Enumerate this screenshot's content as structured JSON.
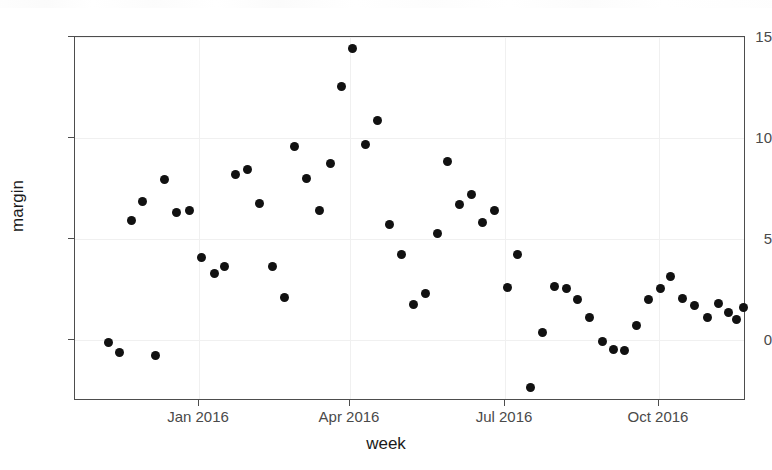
{
  "chart_data": {
    "type": "scatter",
    "title": "",
    "xlabel": "week",
    "ylabel": "margin",
    "grid": true,
    "legend": null,
    "xtick_labels": [
      "Jan 2016",
      "Apr 2016",
      "Jul 2016",
      "Oct 2016"
    ],
    "ytick_labels": [
      "15",
      "10",
      "5",
      "0"
    ],
    "ytick_values": [
      15,
      10,
      5,
      0
    ],
    "ylim": [
      -3.6,
      15.0
    ],
    "xlim_labels": [
      "Nov 2015",
      "Dec 2016"
    ],
    "marker": "filled-circle",
    "marker_color": "#111111",
    "x": [
      "2015-11-15",
      "2015-11-22",
      "2015-11-29",
      "2015-12-06",
      "2015-12-13",
      "2015-12-20",
      "2015-12-27",
      "2016-01-03",
      "2016-01-10",
      "2016-01-17",
      "2016-01-24",
      "2016-01-31",
      "2016-02-07",
      "2016-02-14",
      "2016-02-21",
      "2016-02-28",
      "2016-03-06",
      "2016-03-13",
      "2016-03-20",
      "2016-03-27",
      "2016-04-03",
      "2016-04-10",
      "2016-04-17",
      "2016-04-24",
      "2016-05-01",
      "2016-05-08",
      "2016-05-15",
      "2016-05-22",
      "2016-05-29",
      "2016-06-05",
      "2016-06-12",
      "2016-06-19",
      "2016-06-26",
      "2016-07-03",
      "2016-07-10",
      "2016-07-17",
      "2016-07-24",
      "2016-07-31",
      "2016-08-07",
      "2016-08-14",
      "2016-08-21",
      "2016-08-28",
      "2016-09-04",
      "2016-09-11",
      "2016-09-18",
      "2016-09-25",
      "2016-10-02",
      "2016-10-09",
      "2016-10-16",
      "2016-10-23",
      "2016-10-30",
      "2016-11-06",
      "2016-11-13",
      "2016-11-20",
      "2016-11-27",
      "2016-12-04"
    ],
    "y": [
      0.0,
      -0.6,
      -0.7,
      5.9,
      6.9,
      7.9,
      6.3,
      6.4,
      4.1,
      3.4,
      3.7,
      8.2,
      8.4,
      6.7,
      3.6,
      2.2,
      9.6,
      8.0,
      6.4,
      8.8,
      12.5,
      14.4,
      9.7,
      10.9,
      5.7,
      4.3,
      1.8,
      2.3,
      5.2,
      8.8,
      6.7,
      7.2,
      5.8,
      6.5,
      2.6,
      4.3,
      -2.4,
      0.4,
      2.7,
      2.6,
      2.4,
      1.8,
      1.2,
      0.0,
      -0.3,
      -0.4,
      0.8,
      2.2,
      2.6,
      3.2,
      2.5,
      2.3,
      1.6,
      2.1,
      1.2,
      1.8
    ],
    "points": [
      {
        "px": 107,
        "py": 341
      },
      {
        "px": 118,
        "py": 351
      },
      {
        "px": 154,
        "py": 354
      },
      {
        "px": 130,
        "py": 219
      },
      {
        "px": 141,
        "py": 200
      },
      {
        "px": 163,
        "py": 178
      },
      {
        "px": 175,
        "py": 211
      },
      {
        "px": 188,
        "py": 209
      },
      {
        "px": 200,
        "py": 256
      },
      {
        "px": 213,
        "py": 272
      },
      {
        "px": 223,
        "py": 265
      },
      {
        "px": 234,
        "py": 173
      },
      {
        "px": 246,
        "py": 168
      },
      {
        "px": 258,
        "py": 202
      },
      {
        "px": 271,
        "py": 265
      },
      {
        "px": 283,
        "py": 296
      },
      {
        "px": 293,
        "py": 145
      },
      {
        "px": 305,
        "py": 177
      },
      {
        "px": 318,
        "py": 209
      },
      {
        "px": 329,
        "py": 162
      },
      {
        "px": 340,
        "py": 85
      },
      {
        "px": 351,
        "py": 47
      },
      {
        "px": 364,
        "py": 143
      },
      {
        "px": 376,
        "py": 119
      },
      {
        "px": 388,
        "py": 223
      },
      {
        "px": 400,
        "py": 253
      },
      {
        "px": 412,
        "py": 303
      },
      {
        "px": 424,
        "py": 292
      },
      {
        "px": 436,
        "py": 232
      },
      {
        "px": 446,
        "py": 160
      },
      {
        "px": 458,
        "py": 203
      },
      {
        "px": 470,
        "py": 193
      },
      {
        "px": 481,
        "py": 221
      },
      {
        "px": 493,
        "py": 209
      },
      {
        "px": 506,
        "py": 286
      },
      {
        "px": 516,
        "py": 253
      },
      {
        "px": 529,
        "py": 386
      },
      {
        "px": 541,
        "py": 331
      },
      {
        "px": 553,
        "py": 285
      },
      {
        "px": 565,
        "py": 287
      },
      {
        "px": 576,
        "py": 298
      },
      {
        "px": 588,
        "py": 316
      },
      {
        "px": 601,
        "py": 340
      },
      {
        "px": 612,
        "py": 348
      },
      {
        "px": 623,
        "py": 349
      },
      {
        "px": 635,
        "py": 324
      },
      {
        "px": 647,
        "py": 298
      },
      {
        "px": 659,
        "py": 287
      },
      {
        "px": 669,
        "py": 275
      },
      {
        "px": 681,
        "py": 297
      },
      {
        "px": 693,
        "py": 304
      },
      {
        "px": 706,
        "py": 316
      },
      {
        "px": 717,
        "py": 302
      },
      {
        "px": 727,
        "py": 311
      },
      {
        "px": 735,
        "py": 318
      },
      {
        "px": 742,
        "py": 306
      }
    ]
  },
  "axes": {
    "y_ticks": [
      {
        "label": "15",
        "py": 36
      },
      {
        "label": "10",
        "py": 137
      },
      {
        "label": "5",
        "py": 238
      },
      {
        "label": "0",
        "py": 339
      }
    ],
    "x_ticks": [
      {
        "label": "Jan 2016",
        "px": 198
      },
      {
        "label": "Apr 2016",
        "px": 349
      },
      {
        "label": "Jul 2016",
        "px": 504
      },
      {
        "label": "Oct 2016",
        "px": 658
      }
    ],
    "x_title": "week",
    "y_title": "margin"
  },
  "style": {
    "panel_border_color": "#4d4d4d",
    "grid_color": "#f0f0f0",
    "tick_label_color": "#4a4a4a",
    "axis_title_color": "#1a1a1a",
    "point_color": "#111111",
    "background": "#ffffff"
  }
}
